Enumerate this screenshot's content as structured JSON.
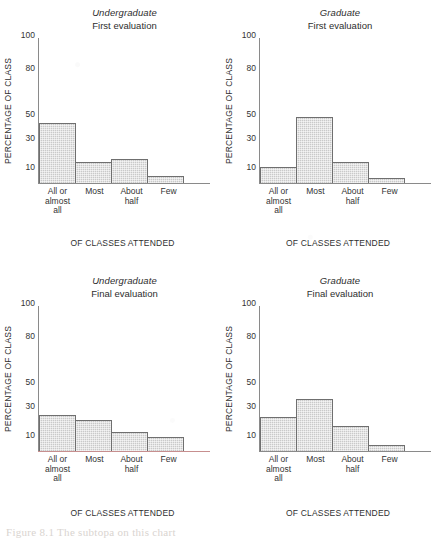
{
  "figure": {
    "caption": "Figure 8.1  The subtopa on this chart",
    "axis_title": "OF CLASSES ATTENDED",
    "y_axis_label": "PERCENTAGE OF CLASS",
    "bar_fill": "#c9c9c9",
    "bar_outline": "#6f6f6f",
    "axis_color": "#8a8a8a",
    "tinted_axis_color": "#c78f8f"
  },
  "y_ticks": [
    {
      "label": "100",
      "value": 100,
      "pos_pct": 95.5
    },
    {
      "label": "80",
      "value": 80,
      "pos_pct": 72.5
    },
    {
      "label": "50",
      "value": 50,
      "pos_pct": 41.0
    },
    {
      "label": "30",
      "value": 30,
      "pos_pct": 24.5
    },
    {
      "label": "10",
      "value": 10,
      "pos_pct": 4.5
    }
  ],
  "categories": [
    [
      "All or",
      "almost",
      "all"
    ],
    [
      "Most"
    ],
    [
      "About",
      "half"
    ],
    [
      "Few"
    ]
  ],
  "panels": [
    {
      "group": "Undergraduate",
      "evaluation": "First evaluation",
      "axis_tinted": false,
      "bar_heights_pct": [
        41.0,
        14.5,
        16.5,
        5.0
      ]
    },
    {
      "group": "Graduate",
      "evaluation": "First evaluation",
      "axis_tinted": false,
      "bar_heights_pct": [
        11.0,
        45.5,
        14.5,
        3.5
      ]
    },
    {
      "group": "Undergraduate",
      "evaluation": "Final evaluation",
      "axis_tinted": true,
      "bar_heights_pct": [
        25.0,
        21.5,
        13.0,
        9.5
      ]
    },
    {
      "group": "Graduate",
      "evaluation": "Final evaluation",
      "axis_tinted": false,
      "bar_heights_pct": [
        23.5,
        35.5,
        17.0,
        4.0
      ]
    }
  ],
  "chart_data": [
    {
      "type": "bar",
      "title": "Undergraduate — First evaluation",
      "xlabel": "OF CLASSES ATTENDED",
      "ylabel": "PERCENTAGE OF CLASS",
      "categories": [
        "All or almost all",
        "Most",
        "About half",
        "Few"
      ],
      "values": [
        50,
        20,
        22,
        8
      ],
      "ytick_labels": [
        "100",
        "80",
        "50",
        "30",
        "10"
      ],
      "ylim": [
        0,
        110
      ],
      "grid": false,
      "legend": "none"
    },
    {
      "type": "bar",
      "title": "Graduate — First evaluation",
      "xlabel": "OF CLASSES ATTENDED",
      "ylabel": "PERCENTAGE OF CLASS",
      "categories": [
        "All or almost all",
        "Most",
        "About half",
        "Few"
      ],
      "values": [
        15,
        55,
        20,
        6
      ],
      "ytick_labels": [
        "100",
        "80",
        "50",
        "30",
        "10"
      ],
      "ylim": [
        0,
        110
      ],
      "grid": false,
      "legend": "none"
    },
    {
      "type": "bar",
      "title": "Undergraduate — Final evaluation",
      "xlabel": "OF CLASSES ATTENDED",
      "ylabel": "PERCENTAGE OF CLASS",
      "categories": [
        "All or almost all",
        "Most",
        "About half",
        "Few"
      ],
      "values": [
        31,
        27,
        17,
        13
      ],
      "ytick_labels": [
        "100",
        "80",
        "50",
        "30",
        "10"
      ],
      "ylim": [
        0,
        110
      ],
      "grid": false,
      "legend": "none"
    },
    {
      "type": "bar",
      "title": "Graduate — Final evaluation",
      "xlabel": "OF CLASSES ATTENDED",
      "ylabel": "PERCENTAGE OF CLASS",
      "categories": [
        "All or almost all",
        "Most",
        "About half",
        "Few"
      ],
      "values": [
        29,
        44,
        23,
        7
      ],
      "ytick_labels": [
        "100",
        "80",
        "50",
        "30",
        "10"
      ],
      "ylim": [
        0,
        110
      ],
      "grid": false,
      "legend": "none"
    }
  ]
}
